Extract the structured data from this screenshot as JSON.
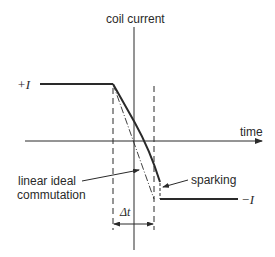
{
  "diagram": {
    "type": "commutation current waveform",
    "axes": {
      "vertical_label": "coil current",
      "horizontal_label": "time"
    },
    "levels": {
      "positive": "+I",
      "negative": "−I"
    },
    "annotations": {
      "linear_line1": "linear ideal",
      "linear_line2": "commutation",
      "sparking": "sparking",
      "interval": "Δt"
    },
    "colors": {
      "ink": "#2a2a2a",
      "background": "#ffffff"
    }
  }
}
